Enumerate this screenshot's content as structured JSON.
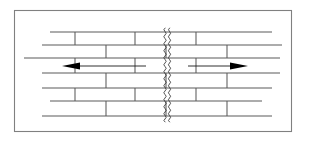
{
  "figure": {
    "frame": {
      "x": 14.5,
      "y": 10.5,
      "width": 277,
      "height": 121,
      "stroke": "#808080",
      "fill": "#ffffff"
    },
    "colors": {
      "mortar": "#5a5a5a",
      "crack": "#333333",
      "arrow": "#000000",
      "frame": "#808080",
      "background": "#ffffff"
    }
  },
  "chart_data": {
    "type": "diagram",
    "bond_pattern": "running bond",
    "courses": [
      {
        "index": 0,
        "y": 32,
        "x_start": 50,
        "x_end": 272,
        "head_joints": [
          75,
          135,
          196
        ]
      },
      {
        "index": 1,
        "y": 45,
        "x_start": 42,
        "x_end": 282,
        "head_joints": [
          106,
          166,
          227
        ]
      },
      {
        "index": 2,
        "y": 58,
        "x_start": 24,
        "x_end": 280,
        "head_joints": [
          75,
          135,
          196
        ]
      },
      {
        "index": 3,
        "y": 73,
        "x_start": 42,
        "x_end": 280,
        "head_joints": [
          106,
          166,
          227
        ]
      },
      {
        "index": 4,
        "y": 88,
        "x_start": 42,
        "x_end": 272,
        "head_joints": [
          75,
          135,
          196
        ]
      },
      {
        "index": 5,
        "y": 101,
        "x_start": 50,
        "x_end": 262,
        "head_joints": [
          106,
          166,
          227
        ]
      },
      {
        "index": 6,
        "y": 116,
        "x_start": 42,
        "x_end": 272,
        "head_joints": [
          75,
          135,
          196
        ]
      }
    ],
    "crack": {
      "label": "vertical wavy crack",
      "orientation": "vertical",
      "x_center": 167,
      "y_top": 28,
      "y_bottom": 122,
      "style": "double wavy line",
      "amplitude": 2.4,
      "wavelength": 7
    },
    "arrows": [
      {
        "name": "left-tension-arrow",
        "direction": "left",
        "y": 66,
        "tail_x": 146,
        "head_x": 62,
        "meaning": "tensile movement away from crack"
      },
      {
        "name": "right-tension-arrow",
        "direction": "right",
        "y": 66,
        "tail_x": 188,
        "head_x": 248,
        "meaning": "tensile movement away from crack"
      }
    ],
    "annotations": []
  }
}
